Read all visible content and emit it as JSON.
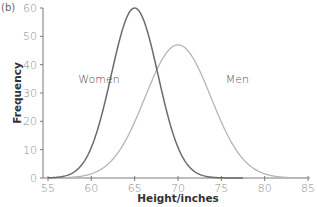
{
  "chart_data": {
    "type": "line",
    "panel_label": "(b)",
    "title": "",
    "xlabel": "Height/inches",
    "ylabel": "Frequency",
    "xlim": [
      55,
      85
    ],
    "ylim": [
      0,
      60
    ],
    "x_ticks": [
      55,
      60,
      65,
      70,
      75,
      80,
      85
    ],
    "y_ticks": [
      0,
      10,
      20,
      30,
      40,
      50,
      60
    ],
    "grid": false,
    "legend": "inline labels",
    "series": [
      {
        "name": "Women",
        "color": "#6b6b6b",
        "distribution": "normal",
        "mean": 65,
        "sd": 2.7,
        "peak": 60,
        "x": [
          55,
          57,
          58,
          59,
          60,
          61,
          62,
          63,
          64,
          65,
          66,
          67,
          68,
          69,
          70,
          71,
          72,
          73,
          75,
          77.5
        ],
        "values": [
          0.3,
          2.5,
          5,
          10,
          17.5,
          26,
          35.5,
          46,
          55,
          60,
          55,
          46,
          35.5,
          26,
          17.5,
          10,
          5,
          2.5,
          0.3,
          0
        ],
        "label_position": {
          "x": 58.5,
          "y": 35
        }
      },
      {
        "name": "Men",
        "color": "#b5b5b5",
        "distribution": "normal",
        "mean": 70,
        "sd": 3.8,
        "peak": 47,
        "x": [
          55,
          58,
          60,
          62,
          64,
          65,
          66,
          67,
          68,
          69,
          70,
          71,
          72,
          73,
          74,
          75,
          76,
          78,
          80,
          82,
          85
        ],
        "values": [
          0,
          1,
          3,
          6.5,
          13,
          19,
          24.5,
          31.5,
          38,
          44,
          47,
          44,
          38,
          31.5,
          24.5,
          19,
          13,
          6.5,
          3,
          1,
          0
        ],
        "label_position": {
          "x": 75.5,
          "y": 35
        }
      }
    ]
  }
}
